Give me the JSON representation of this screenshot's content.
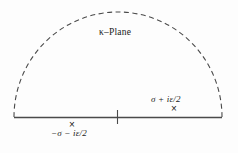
{
  "figure": {
    "title": "",
    "plane_label": "κ–Plane",
    "colors": {
      "background": "#fdfdfd",
      "line": "#4a4a4a",
      "text": "#1a1a1a"
    }
  },
  "chart_data": {
    "type": "diagram",
    "xlabel": "",
    "ylabel": "",
    "grid": false,
    "legend": null,
    "axis": {
      "name": "real-axis",
      "style": "solid",
      "x_start": 14,
      "x_end": 222,
      "y": 117
    },
    "origin_tick": {
      "name": "origin-tick",
      "x": 117,
      "y_top": 110,
      "y_bottom": 124
    },
    "arc": {
      "name": "semicircular-contour",
      "style": "dashed",
      "center_x": 118,
      "center_y": 117,
      "radius_x": 104,
      "radius_y": 105,
      "sweep": "upper-half-plane"
    },
    "poles": [
      {
        "name": "pole-right",
        "label": "σ + iε/2",
        "marker": "×",
        "x": 176,
        "y": 109,
        "label_position": "above"
      },
      {
        "name": "pole-left",
        "label": "−σ − iε/2",
        "marker": "×",
        "x": 74,
        "y": 125,
        "label_position": "below"
      }
    ]
  },
  "labels": {
    "plane": "κ–Plane",
    "pole_right": "σ + iε/2",
    "pole_left": "−σ − iε/2",
    "marker_glyph": "×"
  }
}
